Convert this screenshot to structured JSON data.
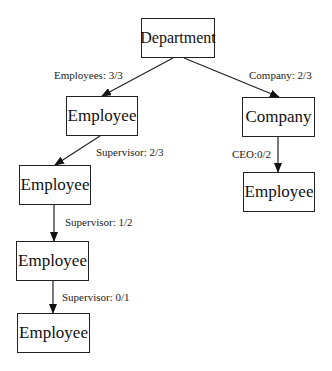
{
  "nodes": {
    "department": {
      "label": "Department"
    },
    "employee_1": {
      "label": "Employee"
    },
    "company": {
      "label": "Company"
    },
    "employee_2": {
      "label": "Employee"
    },
    "employee_ceo": {
      "label": "Employee"
    },
    "employee_3": {
      "label": "Employee"
    },
    "employee_4": {
      "label": "Employee"
    }
  },
  "edges": {
    "dept_employees": {
      "label": "Employees: 3/3"
    },
    "dept_company": {
      "label": "Company: 2/3"
    },
    "emp1_supervisor": {
      "label": "Supervisor: 2/3"
    },
    "company_ceo": {
      "label": "CEO:0/2"
    },
    "emp2_supervisor": {
      "label": "Supervisor: 1/2"
    },
    "emp3_supervisor": {
      "label": "Supervisor: 0/1"
    }
  }
}
